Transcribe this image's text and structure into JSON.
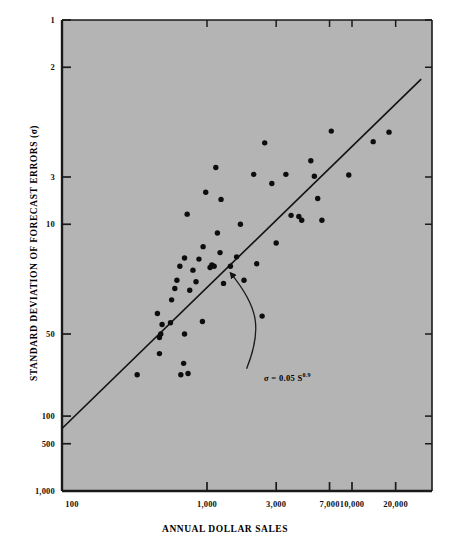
{
  "figure": {
    "plot_background_color": "#b4b4b4",
    "axis_color": "#1a1a1a",
    "point_color": "#0d0d0d",
    "fit_line_color": "#111111"
  },
  "axes": {
    "y_title": "STANDARD DEVIATION OF FORECAST ERRORS (σ)",
    "x_title": "ANNUAL DOLLAR SALES",
    "y_tick_labels": [
      "1,000",
      "500",
      "100",
      "50",
      "10",
      "3",
      "2",
      "1"
    ],
    "y_tick_values": [
      1000,
      500,
      100,
      50,
      10,
      3,
      2,
      1
    ],
    "x_tick_labels": [
      "100",
      "1,000",
      "3,000",
      "7,000",
      "10,000",
      "20,000"
    ],
    "x_tick_values": [
      100,
      1000,
      3000,
      7000,
      10000,
      20000
    ]
  },
  "annotation": {
    "sigma_symbol": "σ",
    "equals": "=",
    "coefficient": "0.05",
    "variable": "S",
    "exponent": "0.9",
    "full_text": "σ = 0.05 S0.9"
  },
  "chart_data": {
    "type": "scatter",
    "title": "",
    "subtitle": "",
    "xlabel": "ANNUAL DOLLAR SALES",
    "ylabel": "STANDARD DEVIATION OF FORECAST ERRORS (σ)",
    "xscale": "log",
    "yscale": "log",
    "xlim": [
      100,
      30000
    ],
    "ylim": [
      1,
      1000
    ],
    "grid": false,
    "legend": null,
    "xticks": [
      100,
      1000,
      3000,
      7000,
      10000,
      20000
    ],
    "xticklabels": [
      "100",
      "1,000",
      "3,000",
      "7,000",
      "10,000",
      "20,000"
    ],
    "yticks": [
      1,
      2,
      3,
      10,
      50,
      100,
      500,
      1000
    ],
    "yticklabels": [
      "1",
      "2",
      "3",
      "10",
      "50",
      "100",
      "500",
      "1,000"
    ],
    "fit_line": {
      "equation": "sigma = 0.05 * S^0.9",
      "coefficient": 0.05,
      "exponent": 0.9,
      "x_start": 100,
      "y_start": 2.5,
      "x_end": 30000,
      "y_end": 420
    },
    "annotations": [
      {
        "text": "σ = 0.05 S^0.9",
        "x": 2000,
        "y": 5.5,
        "arrow_to_x": 1450,
        "arrow_to_y": 26
      }
    ],
    "points": [
      {
        "x": 330,
        "y": 5.5
      },
      {
        "x": 470,
        "y": 7.5
      },
      {
        "x": 470,
        "y": 9.5
      },
      {
        "x": 480,
        "y": 10.0
      },
      {
        "x": 490,
        "y": 11.5
      },
      {
        "x": 455,
        "y": 13.5
      },
      {
        "x": 560,
        "y": 11.8
      },
      {
        "x": 570,
        "y": 16.5
      },
      {
        "x": 600,
        "y": 19.5
      },
      {
        "x": 620,
        "y": 22.0
      },
      {
        "x": 650,
        "y": 27.0
      },
      {
        "x": 660,
        "y": 5.5
      },
      {
        "x": 690,
        "y": 6.5
      },
      {
        "x": 700,
        "y": 10.0
      },
      {
        "x": 740,
        "y": 5.6
      },
      {
        "x": 700,
        "y": 30.5
      },
      {
        "x": 730,
        "y": 58.0
      },
      {
        "x": 760,
        "y": 19.0
      },
      {
        "x": 800,
        "y": 25.5
      },
      {
        "x": 840,
        "y": 21.5
      },
      {
        "x": 880,
        "y": 30.0
      },
      {
        "x": 930,
        "y": 12.0
      },
      {
        "x": 940,
        "y": 36.0
      },
      {
        "x": 980,
        "y": 80.0
      },
      {
        "x": 1050,
        "y": 26.5
      },
      {
        "x": 1080,
        "y": 27.5
      },
      {
        "x": 1120,
        "y": 27.0
      },
      {
        "x": 1150,
        "y": 115.0
      },
      {
        "x": 1180,
        "y": 44.0
      },
      {
        "x": 1230,
        "y": 33.0
      },
      {
        "x": 1250,
        "y": 72.0
      },
      {
        "x": 1300,
        "y": 21.0
      },
      {
        "x": 1450,
        "y": 27.0
      },
      {
        "x": 1600,
        "y": 31.0
      },
      {
        "x": 1700,
        "y": 50.0
      },
      {
        "x": 1800,
        "y": 22.0
      },
      {
        "x": 2100,
        "y": 104.0
      },
      {
        "x": 2200,
        "y": 28.0
      },
      {
        "x": 2400,
        "y": 13.0
      },
      {
        "x": 2500,
        "y": 165.0
      },
      {
        "x": 2800,
        "y": 91.0
      },
      {
        "x": 3000,
        "y": 38.0
      },
      {
        "x": 3500,
        "y": 104.0
      },
      {
        "x": 3800,
        "y": 57.0
      },
      {
        "x": 4300,
        "y": 56.0
      },
      {
        "x": 4500,
        "y": 53.0
      },
      {
        "x": 5200,
        "y": 127.0
      },
      {
        "x": 5500,
        "y": 101.0
      },
      {
        "x": 5800,
        "y": 73.0
      },
      {
        "x": 6200,
        "y": 53.0
      },
      {
        "x": 7200,
        "y": 196.0
      },
      {
        "x": 9500,
        "y": 103.0
      },
      {
        "x": 14000,
        "y": 168.0
      },
      {
        "x": 18000,
        "y": 193.0
      }
    ]
  }
}
